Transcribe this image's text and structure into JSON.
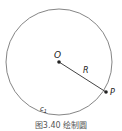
{
  "figure": {
    "caption": "图3.40  绘制圆",
    "center_label": "O",
    "radius_label": "R",
    "point_label": "P",
    "curve_label": "c1",
    "colors": {
      "stroke": "#555555",
      "point": "#222222",
      "text": "#222222"
    }
  }
}
